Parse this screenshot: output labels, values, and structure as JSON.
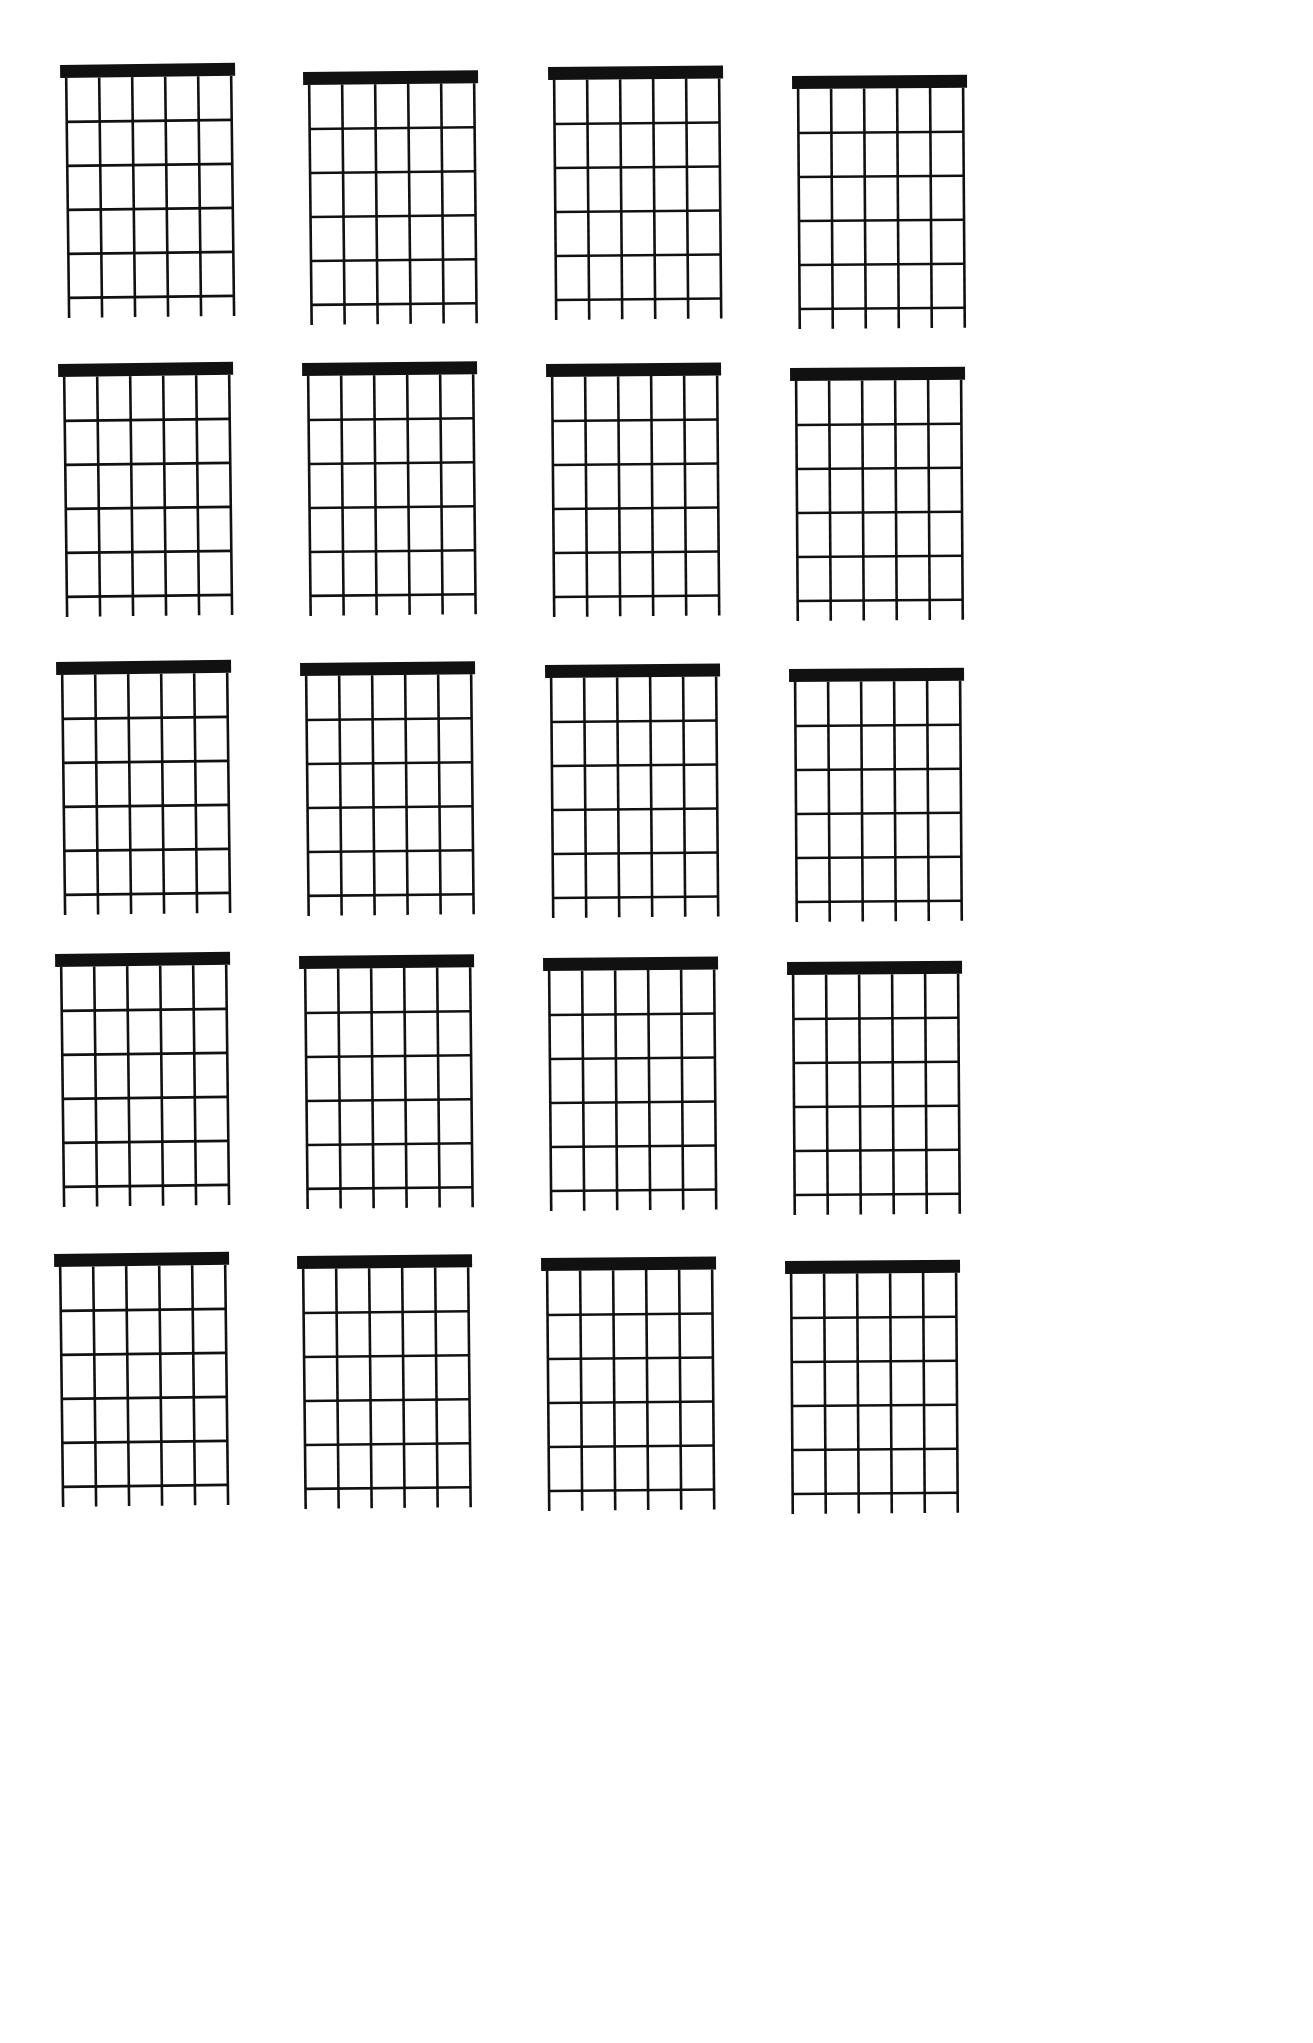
{
  "document": {
    "title": "Blank Guitar Chord Chart Sheet",
    "page_background": "#ffffff",
    "ink_color": "#111111",
    "width": 1313,
    "height": 2043
  },
  "chart_data": {
    "type": "table",
    "columns": 4,
    "rows": 5,
    "total_diagrams": 20,
    "diagram_spec": {
      "strings": 6,
      "string_labels": [
        "6",
        "5",
        "4",
        "3",
        "2",
        "1"
      ],
      "frets": 5,
      "fret_labels": [
        "1",
        "2",
        "3",
        "4",
        "5"
      ],
      "nut": true,
      "nut_thickness_px": 13,
      "string_spacing_px": 33,
      "fret_spacing_px": 44,
      "string_overhang_px": 20,
      "width_px": 165,
      "height_px": 240,
      "markers": [],
      "open_strings": [],
      "muted_strings": [],
      "barre": null,
      "fret_position_label": "",
      "chord_name": ""
    },
    "columns_x": [
      60,
      300,
      540,
      790
    ],
    "rows_y": [
      63,
      363,
      663,
      955,
      1255
    ],
    "diagrams": [
      {
        "id": 1,
        "row": 1,
        "col": 1,
        "x": 60,
        "y": 63,
        "skew_deg": -0.7
      },
      {
        "id": 2,
        "row": 1,
        "col": 2,
        "x": 303,
        "y": 70,
        "skew_deg": -0.6
      },
      {
        "id": 3,
        "row": 1,
        "col": 3,
        "x": 548,
        "y": 65,
        "skew_deg": -0.5
      },
      {
        "id": 4,
        "row": 1,
        "col": 4,
        "x": 792,
        "y": 74,
        "skew_deg": -0.4
      },
      {
        "id": 5,
        "row": 2,
        "col": 1,
        "x": 58,
        "y": 362,
        "skew_deg": -0.7
      },
      {
        "id": 6,
        "row": 2,
        "col": 2,
        "x": 302,
        "y": 361,
        "skew_deg": -0.6
      },
      {
        "id": 7,
        "row": 2,
        "col": 3,
        "x": 546,
        "y": 362,
        "skew_deg": -0.5
      },
      {
        "id": 8,
        "row": 2,
        "col": 4,
        "x": 790,
        "y": 366,
        "skew_deg": -0.4
      },
      {
        "id": 9,
        "row": 3,
        "col": 1,
        "x": 56,
        "y": 660,
        "skew_deg": -0.7
      },
      {
        "id": 10,
        "row": 3,
        "col": 2,
        "x": 300,
        "y": 661,
        "skew_deg": -0.6
      },
      {
        "id": 11,
        "row": 3,
        "col": 3,
        "x": 545,
        "y": 663,
        "skew_deg": -0.5
      },
      {
        "id": 12,
        "row": 3,
        "col": 4,
        "x": 789,
        "y": 667,
        "skew_deg": -0.4
      },
      {
        "id": 13,
        "row": 4,
        "col": 1,
        "x": 55,
        "y": 952,
        "skew_deg": -0.7
      },
      {
        "id": 14,
        "row": 4,
        "col": 2,
        "x": 299,
        "y": 954,
        "skew_deg": -0.6
      },
      {
        "id": 15,
        "row": 4,
        "col": 3,
        "x": 543,
        "y": 956,
        "skew_deg": -0.5
      },
      {
        "id": 16,
        "row": 4,
        "col": 4,
        "x": 787,
        "y": 960,
        "skew_deg": -0.4
      },
      {
        "id": 17,
        "row": 5,
        "col": 1,
        "x": 54,
        "y": 1252,
        "skew_deg": -0.7
      },
      {
        "id": 18,
        "row": 5,
        "col": 2,
        "x": 297,
        "y": 1254,
        "skew_deg": -0.6
      },
      {
        "id": 19,
        "row": 5,
        "col": 3,
        "x": 541,
        "y": 1256,
        "skew_deg": -0.5
      },
      {
        "id": 20,
        "row": 5,
        "col": 4,
        "x": 785,
        "y": 1259,
        "skew_deg": -0.4
      }
    ]
  }
}
